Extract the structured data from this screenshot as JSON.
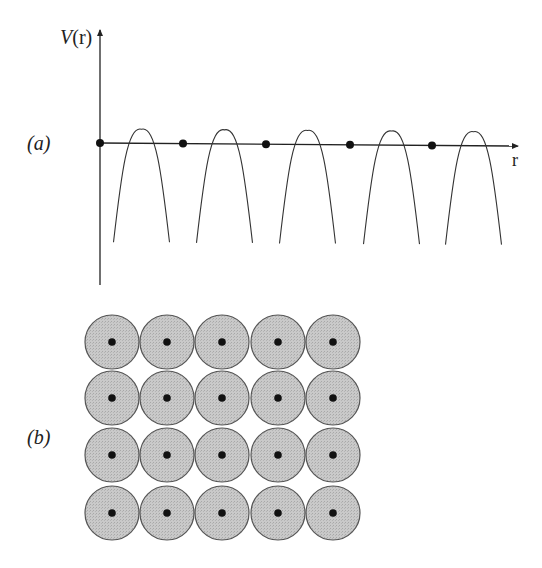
{
  "panel_a": {
    "label": "(a)",
    "y_axis_label_italic": "V",
    "y_axis_label_rest": "(r)",
    "x_axis_label": "r",
    "axis_y": 143,
    "origin_x": 100,
    "period": 83,
    "cells": 5,
    "atom_positions_x": [
      100,
      183,
      266,
      350,
      432
    ],
    "well_peak_y": 129,
    "well_bottom_y": 242,
    "well_half_width_bottom": 28
  },
  "panel_b": {
    "label": "(b)",
    "rows": 4,
    "cols": 5,
    "centers_x": [
      112,
      167,
      222,
      278,
      333
    ],
    "centers_y": [
      342,
      398,
      455,
      513
    ],
    "radius": 27,
    "fill_color": "#c4c4c4",
    "stroke_color": "#555555",
    "nucleus_color": "#111111"
  },
  "chart_data": {
    "type": "diagram",
    "title": "",
    "panels": [
      {
        "id": "a",
        "description": "Periodic potential V(r) along r with atom sites marked as dots on the r axis; inverted parabolic wells between sites",
        "xlabel": "r",
        "ylabel": "V(r)",
        "atom_sites": 5,
        "wells": 5
      },
      {
        "id": "b",
        "description": "4 x 5 grid of shaded circles (atomic cells) each with a central black dot (nucleus)",
        "rows": 4,
        "cols": 5
      }
    ]
  }
}
